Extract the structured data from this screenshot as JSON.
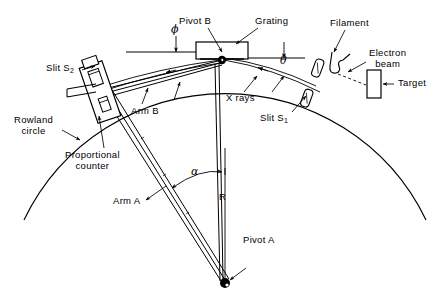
{
  "figure": {
    "type": "schematic-diagram",
    "background_color": "#ffffff",
    "line_color": "#000000"
  },
  "labels": {
    "pivot_b": "Pivot B",
    "grating": "Grating",
    "filament": "Filament",
    "electron_beam_line1": "Electron",
    "electron_beam_line2": "beam",
    "target": "Target",
    "slit_s1_pre": "Slit S",
    "slit_s1_sub": "1",
    "slit_s2_pre": "Slit S",
    "slit_s2_sub": "2",
    "x_rays": "X rays",
    "arm_b": "Arm B",
    "arm_a": "Arm A",
    "rowland_line1": "Rowland",
    "rowland_line2": "circle",
    "proportional_line1": "Proportional",
    "proportional_line2": "counter",
    "pivot_a": "Pivot A",
    "radius": "R",
    "angle_phi": "ϕ",
    "angle_theta": "θ",
    "angle_alpha": "α"
  },
  "geometry": {
    "pivot_b_point": [
      222,
      60
    ],
    "pivot_a_point": [
      225,
      283
    ],
    "counter_point": [
      100,
      88
    ],
    "slit_s1_point": [
      312,
      83
    ],
    "rowland_circle_radius": 223,
    "rowland_circle_center": [
      225,
      283
    ]
  }
}
